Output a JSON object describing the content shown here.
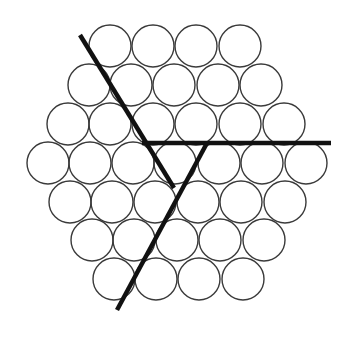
{
  "diagram": {
    "title": "",
    "canvas": {
      "width": 349,
      "height": 337,
      "background": "#ffffff"
    },
    "circle_style": {
      "radius": 21,
      "stroke": "#3a3a3a",
      "stroke_width": 1.4
    },
    "line_style": {
      "stroke": "#111111",
      "stroke_width": 4.5
    },
    "rows": [
      {
        "y": 46,
        "xs": [
          110,
          153,
          196,
          240
        ]
      },
      {
        "y": 85,
        "xs": [
          89,
          131,
          174,
          218,
          261
        ]
      },
      {
        "y": 124,
        "xs": [
          68,
          110,
          153,
          196,
          240,
          284
        ]
      },
      {
        "y": 163,
        "xs": [
          48,
          90,
          133,
          175,
          219,
          262,
          306
        ]
      },
      {
        "y": 202,
        "xs": [
          70,
          112,
          155,
          198,
          241,
          285
        ]
      },
      {
        "y": 240,
        "xs": [
          92,
          134,
          177,
          220,
          264
        ]
      },
      {
        "y": 279,
        "xs": [
          114,
          156,
          199,
          243
        ]
      }
    ],
    "lines": [
      {
        "name": "diagonal-boundary-upper-left",
        "x1": 80,
        "y1": 35,
        "x2": 174,
        "y2": 188
      },
      {
        "name": "horizontal-boundary-right",
        "x1": 142,
        "y1": 143,
        "x2": 331,
        "y2": 143
      },
      {
        "name": "diagonal-boundary-lower-left",
        "x1": 207,
        "y1": 143,
        "x2": 117,
        "y2": 310
      }
    ]
  }
}
